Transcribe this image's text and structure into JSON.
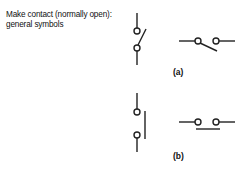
{
  "title": {
    "line1": "Make contact (normally open):",
    "line2": "general symbols"
  },
  "symbols": [
    {
      "id": "a",
      "label": "(a)",
      "description": "make contact, angled blade, vertical and horizontal orientation"
    },
    {
      "id": "b",
      "label": "(b)",
      "description": "make contact, parallel bar, vertical and horizontal orientation"
    }
  ],
  "colors": {
    "stroke": "#222222",
    "background": "#ffffff",
    "text": "#111111"
  }
}
